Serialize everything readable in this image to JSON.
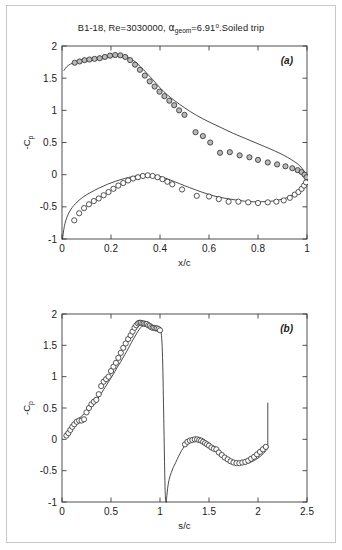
{
  "figure": {
    "title_parts": {
      "lead": "B1-18, Re=3030000, ",
      "alpha": "α",
      "alpha_sub": "geom",
      "alpha_val": "=6.91",
      "degree": "o",
      "tail": ".Soiled trip"
    },
    "title_plain": "B1-18, Re=3030000, αgeom=6.91°.Soiled trip",
    "background": "#ffffff",
    "frame_color": "#c9c9c9",
    "curve_color": "#2b2b2b",
    "marker_upper_fill": "#b9b9b9",
    "marker_lower_fill": "#ffffff",
    "marker_edge": "#2b2b2b"
  },
  "chart_data": [
    {
      "type": "scatter",
      "panel": "(a)",
      "title": "",
      "xlabel": "x/c",
      "ylabel": "-C_p",
      "xlim": [
        0,
        1
      ],
      "ylim": [
        -1,
        2
      ],
      "xticks": [
        0,
        0.2,
        0.4,
        0.6,
        0.8,
        1
      ],
      "xticklabels": [
        "0",
        "0.2",
        "0.4",
        "0.6",
        "0.8",
        "1"
      ],
      "yticks": [
        -1,
        -0.5,
        0,
        0.5,
        1,
        1.5,
        2
      ],
      "yticklabels": [
        "-1",
        "-0.5",
        "0",
        "0.5",
        "1",
        "1.5",
        "2"
      ],
      "grid": false,
      "legend": "none",
      "series": [
        {
          "name": "upper surface measured",
          "marker": "filled-circle",
          "x": [
            0.052,
            0.072,
            0.092,
            0.112,
            0.133,
            0.154,
            0.175,
            0.196,
            0.217,
            0.238,
            0.258,
            0.278,
            0.298,
            0.318,
            0.338,
            0.358,
            0.378,
            0.398,
            0.418,
            0.438,
            0.458,
            0.478,
            0.5,
            0.545,
            0.575,
            0.605,
            0.645,
            0.685,
            0.725,
            0.765,
            0.8,
            0.84,
            0.878,
            0.912,
            0.94,
            0.962,
            0.978,
            0.99,
            0.998
          ],
          "y": [
            1.74,
            1.76,
            1.78,
            1.79,
            1.8,
            1.81,
            1.83,
            1.85,
            1.86,
            1.855,
            1.83,
            1.78,
            1.71,
            1.63,
            1.54,
            1.45,
            1.37,
            1.29,
            1.22,
            1.15,
            1.08,
            1.0,
            0.93,
            0.66,
            0.6,
            0.5,
            0.34,
            0.35,
            0.3,
            0.27,
            0.23,
            0.19,
            0.16,
            0.13,
            0.1,
            0.07,
            0.04,
            0.0,
            -0.04
          ]
        },
        {
          "name": "lower surface measured",
          "marker": "open-circle",
          "x": [
            0.05,
            0.07,
            0.09,
            0.11,
            0.13,
            0.15,
            0.17,
            0.19,
            0.21,
            0.23,
            0.25,
            0.27,
            0.29,
            0.31,
            0.33,
            0.35,
            0.37,
            0.39,
            0.41,
            0.43,
            0.45,
            0.49,
            0.55,
            0.6,
            0.64,
            0.68,
            0.72,
            0.76,
            0.8,
            0.84,
            0.875,
            0.905,
            0.93,
            0.95,
            0.965,
            0.978,
            0.988,
            0.996
          ],
          "y": [
            -0.71,
            -0.6,
            -0.52,
            -0.46,
            -0.41,
            -0.37,
            -0.32,
            -0.27,
            -0.22,
            -0.17,
            -0.13,
            -0.09,
            -0.06,
            -0.04,
            -0.02,
            -0.01,
            -0.02,
            -0.04,
            -0.07,
            -0.11,
            -0.15,
            -0.23,
            -0.33,
            -0.34,
            -0.38,
            -0.42,
            -0.42,
            -0.43,
            -0.44,
            -0.43,
            -0.42,
            -0.4,
            -0.36,
            -0.31,
            -0.27,
            -0.22,
            -0.17,
            -0.12
          ]
        },
        {
          "name": "upper surface computed",
          "marker": "none",
          "style": "line",
          "x": [
            0.008,
            0.02,
            0.035,
            0.055,
            0.08,
            0.11,
            0.14,
            0.17,
            0.2,
            0.23,
            0.255,
            0.28,
            0.3,
            0.32,
            0.345,
            0.37,
            0.4,
            0.43,
            0.46,
            0.5,
            0.55,
            0.6,
            0.65,
            0.7,
            0.75,
            0.8,
            0.85,
            0.89,
            0.92,
            0.95,
            0.97,
            0.985,
            0.995,
            1.0
          ],
          "y": [
            1.62,
            1.68,
            1.72,
            1.745,
            1.76,
            1.775,
            1.79,
            1.81,
            1.83,
            1.845,
            1.84,
            1.8,
            1.75,
            1.68,
            1.58,
            1.48,
            1.35,
            1.24,
            1.15,
            1.04,
            0.92,
            0.82,
            0.73,
            0.64,
            0.56,
            0.48,
            0.4,
            0.33,
            0.27,
            0.2,
            0.14,
            0.07,
            0.0,
            -0.14
          ]
        },
        {
          "name": "lower surface computed",
          "marker": "none",
          "style": "line",
          "x": [
            0.002,
            0.012,
            0.03,
            0.055,
            0.085,
            0.115,
            0.15,
            0.185,
            0.22,
            0.255,
            0.29,
            0.32,
            0.35,
            0.38,
            0.41,
            0.44,
            0.48,
            0.52,
            0.57,
            0.62,
            0.67,
            0.72,
            0.77,
            0.82,
            0.86,
            0.9,
            0.93,
            0.955,
            0.975,
            0.99,
            1.0
          ],
          "y": [
            -1.0,
            -0.76,
            -0.58,
            -0.45,
            -0.35,
            -0.28,
            -0.21,
            -0.15,
            -0.1,
            -0.06,
            -0.03,
            -0.01,
            0.0,
            -0.01,
            -0.04,
            -0.08,
            -0.14,
            -0.2,
            -0.27,
            -0.33,
            -0.37,
            -0.4,
            -0.42,
            -0.42,
            -0.41,
            -0.38,
            -0.34,
            -0.29,
            -0.23,
            -0.17,
            -0.14
          ]
        }
      ]
    },
    {
      "type": "scatter",
      "panel": "(b)",
      "title": "",
      "xlabel": "s/c",
      "ylabel": "-C_p",
      "xlim": [
        0,
        2.5
      ],
      "ylim": [
        -1,
        2
      ],
      "xticks": [
        0,
        0.5,
        1,
        1.5,
        2,
        2.5
      ],
      "xticklabels": [
        "0",
        "0.5",
        "1",
        "1.5",
        "2",
        "2.5"
      ],
      "yticks": [
        -1,
        -0.5,
        0,
        0.5,
        1,
        1.5,
        2
      ],
      "yticklabels": [
        "-1",
        "-0.5",
        "0",
        "0.5",
        "1",
        "1.5",
        "2"
      ],
      "grid": false,
      "legend": "none",
      "series": [
        {
          "name": "upper surface measured",
          "marker": "open-circle",
          "x": [
            0.045,
            0.065,
            0.085,
            0.105,
            0.125,
            0.15,
            0.175,
            0.2,
            0.225,
            0.25,
            0.275,
            0.3,
            0.325,
            0.35,
            0.375,
            0.4,
            0.425,
            0.45,
            0.475,
            0.5,
            0.525,
            0.55,
            0.575,
            0.6,
            0.625,
            0.65,
            0.675,
            0.7,
            0.72,
            0.74,
            0.758,
            0.775,
            0.79,
            0.805,
            0.82,
            0.835,
            0.85,
            0.865,
            0.88,
            0.895,
            0.91,
            0.925,
            0.94,
            0.955,
            0.97,
            0.985,
            1.0
          ],
          "y": [
            0.06,
            0.1,
            0.15,
            0.2,
            0.24,
            0.28,
            0.3,
            0.3,
            0.32,
            0.43,
            0.5,
            0.56,
            0.6,
            0.63,
            0.72,
            0.85,
            0.92,
            0.96,
            1.0,
            1.09,
            1.16,
            1.22,
            1.3,
            1.38,
            1.46,
            1.53,
            1.6,
            1.66,
            1.72,
            1.78,
            1.82,
            1.85,
            1.86,
            1.86,
            1.85,
            1.85,
            1.84,
            1.84,
            1.82,
            1.81,
            1.79,
            1.78,
            1.78,
            1.77,
            1.77,
            1.76,
            1.74
          ]
        },
        {
          "name": "lower surface measured",
          "marker": "open-circle",
          "x": [
            1.255,
            1.28,
            1.305,
            1.33,
            1.355,
            1.378,
            1.4,
            1.42,
            1.44,
            1.46,
            1.48,
            1.5,
            1.525,
            1.55,
            1.575,
            1.6,
            1.63,
            1.66,
            1.69,
            1.72,
            1.75,
            1.78,
            1.81,
            1.84,
            1.87,
            1.9,
            1.93,
            1.96,
            1.99,
            2.02,
            2.05,
            2.08
          ],
          "y": [
            -0.08,
            -0.04,
            -0.02,
            -0.01,
            0.0,
            0.0,
            -0.01,
            -0.02,
            -0.04,
            -0.06,
            -0.08,
            -0.1,
            -0.13,
            -0.15,
            -0.16,
            -0.21,
            -0.25,
            -0.29,
            -0.32,
            -0.35,
            -0.37,
            -0.38,
            -0.38,
            -0.37,
            -0.36,
            -0.34,
            -0.31,
            -0.28,
            -0.24,
            -0.2,
            -0.16,
            -0.12
          ]
        },
        {
          "name": "computed upper branch",
          "marker": "none",
          "style": "line",
          "x": [
            0.03,
            0.06,
            0.09,
            0.12,
            0.16,
            0.2,
            0.24,
            0.28,
            0.32,
            0.36,
            0.4,
            0.44,
            0.48,
            0.52,
            0.56,
            0.6,
            0.64,
            0.68,
            0.71,
            0.74,
            0.77,
            0.8,
            0.83,
            0.86,
            0.89,
            0.92,
            0.95,
            0.98,
            1.0,
            1.01,
            1.02,
            1.028,
            1.034,
            1.04,
            1.046,
            1.052,
            1.058,
            1.062
          ],
          "y": [
            0.08,
            0.14,
            0.2,
            0.26,
            0.32,
            0.37,
            0.43,
            0.49,
            0.56,
            0.64,
            0.73,
            0.83,
            0.93,
            1.03,
            1.14,
            1.24,
            1.35,
            1.46,
            1.55,
            1.63,
            1.71,
            1.78,
            1.82,
            1.85,
            1.85,
            1.82,
            1.78,
            1.75,
            1.74,
            1.72,
            1.55,
            1.2,
            0.7,
            0.2,
            -0.35,
            -0.8,
            -0.98,
            -1.0
          ]
        },
        {
          "name": "computed lower branch",
          "marker": "none",
          "style": "line",
          "x": [
            1.064,
            1.07,
            1.078,
            1.088,
            1.1,
            1.115,
            1.135,
            1.16,
            1.19,
            1.22,
            1.25,
            1.28,
            1.31,
            1.34,
            1.37,
            1.4,
            1.43,
            1.46,
            1.49,
            1.52,
            1.56,
            1.6,
            1.64,
            1.68,
            1.72,
            1.76,
            1.8,
            1.84,
            1.88,
            1.92,
            1.96,
            2.0,
            2.04,
            2.07,
            2.09,
            2.1
          ],
          "y": [
            -1.0,
            -0.9,
            -0.78,
            -0.68,
            -0.6,
            -0.53,
            -0.45,
            -0.37,
            -0.27,
            -0.18,
            -0.11,
            -0.06,
            -0.03,
            -0.01,
            0.0,
            -0.01,
            -0.03,
            -0.06,
            -0.09,
            -0.12,
            -0.17,
            -0.22,
            -0.27,
            -0.31,
            -0.35,
            -0.37,
            -0.39,
            -0.4,
            -0.39,
            -0.37,
            -0.34,
            -0.3,
            -0.25,
            -0.2,
            -0.16,
            -0.13
          ]
        },
        {
          "name": "trailing edge vertical",
          "marker": "none",
          "style": "line",
          "x": [
            2.1,
            2.1
          ],
          "y": [
            -0.13,
            0.58
          ]
        }
      ]
    }
  ]
}
